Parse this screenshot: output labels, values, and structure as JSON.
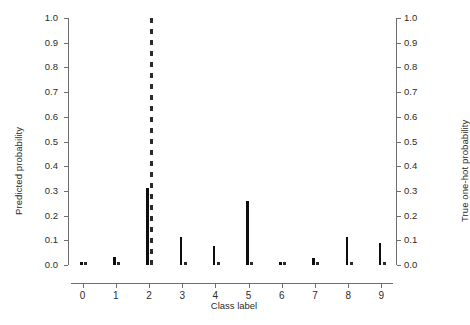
{
  "chart_data": {
    "type": "bar",
    "title": "",
    "xlabel": "Class label",
    "ylabel": "Predicted probability",
    "ylabel_right": "True one-hot probability",
    "categories": [
      "0",
      "1",
      "2",
      "3",
      "4",
      "5",
      "6",
      "7",
      "8",
      "9"
    ],
    "x": [
      0,
      1,
      2,
      3,
      4,
      5,
      6,
      7,
      8,
      9
    ],
    "xlim": [
      -0.35,
      9.35
    ],
    "ylim": [
      0.0,
      1.0
    ],
    "ylim_right": [
      0.0,
      1.0
    ],
    "grid": false,
    "legend": null,
    "yticks": [
      "1.0",
      "0.9",
      "0.8",
      "0.7",
      "0.6",
      "0.5",
      "0.4",
      "0.3",
      "0.2",
      "0.1",
      "0.0"
    ],
    "ytick_values": [
      1.0,
      0.9,
      0.8,
      0.7,
      0.6,
      0.5,
      0.4,
      0.3,
      0.2,
      0.1,
      0.0
    ],
    "yticks_right": [
      "1.0",
      "0.9",
      "0.8",
      "0.7",
      "0.6",
      "0.5",
      "0.4",
      "0.3",
      "0.2",
      "0.1",
      "0.0"
    ],
    "series": [
      {
        "name": "Predicted probability",
        "style": "solid-bar",
        "color": "#0d0d0d",
        "values": [
          0.013,
          0.032,
          0.31,
          0.112,
          0.077,
          0.258,
          0.011,
          0.03,
          0.113,
          0.088
        ]
      },
      {
        "name": "True one-hot probability",
        "style": "dashed-bar",
        "color": "#2a2a2a",
        "values": [
          0.0,
          0.0,
          1.0,
          0.0,
          0.0,
          0.0,
          0.0,
          0.0,
          0.0,
          0.0
        ]
      }
    ],
    "true_class": 2,
    "annotations": []
  },
  "axes": {
    "left_title": "Predicted probability",
    "right_title": "True one-hot probability",
    "bottom_title": "Class label"
  }
}
